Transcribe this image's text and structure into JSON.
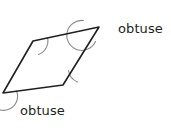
{
  "figure": {
    "name": "parallelogram-obtuse-angles",
    "width": 171,
    "height": 131,
    "background_color": "#ffffff",
    "edge_color": "#231f20",
    "arc_color": "#8a8a8a",
    "text_color": "#231f20",
    "shape": {
      "type": "parallelogram",
      "vertices": [
        {
          "id": "left",
          "x": 3,
          "y": 93
        },
        {
          "id": "top-left",
          "x": 33,
          "y": 41
        },
        {
          "id": "top-right",
          "x": 99,
          "y": 27
        },
        {
          "id": "bottom-right",
          "x": 63,
          "y": 85
        }
      ],
      "path": "M 3 93 L 33 41 L 99 27 L 63 85 Z"
    },
    "angle_markers": [
      {
        "id": "top-left-acute",
        "vertex": "top-left",
        "kind": "acute",
        "path": "M 47 38 A 14 14 0 0 1 39 54"
      },
      {
        "id": "bottom-right-acute",
        "vertex": "bottom-right",
        "kind": "acute",
        "path": "M 77 82 A 14 14 0 0 1 69 71"
      },
      {
        "id": "top-right-obtuse",
        "vertex": "top-right",
        "kind": "obtuse-reflex",
        "path": "M 94 41 A 15 15 0 1 1 82 22"
      },
      {
        "id": "left-obtuse",
        "vertex": "left",
        "kind": "obtuse-reflex",
        "path": "M 16 91 A 14 14 0 1 1 -2 82"
      }
    ]
  },
  "labels": {
    "top_right": "obtuse",
    "bottom_left": "obtuse"
  }
}
